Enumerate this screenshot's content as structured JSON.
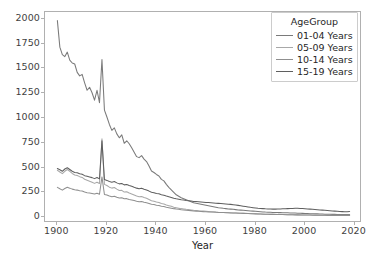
{
  "chart_data": {
    "type": "line",
    "title": "",
    "xlabel": "Year",
    "ylabel": "",
    "xlim": [
      1895,
      2023
    ],
    "ylim": [
      -60,
      2070
    ],
    "grid": false,
    "legend": {
      "title": "AgeGroup",
      "position": "upper right",
      "entries": [
        "01-04 Years",
        "05-09 Years",
        "10-14 Years",
        "15-19 Years"
      ]
    },
    "xticks": [
      1900,
      1920,
      1940,
      1960,
      1980,
      2000,
      2020
    ],
    "yticks": [
      0,
      250,
      500,
      750,
      1000,
      1250,
      1500,
      1750,
      2000
    ],
    "colors": {
      "01-04 Years": "#7a7a7a",
      "05-09 Years": "#a8a8a8",
      "10-14 Years": "#8f8f8f",
      "15-19 Years": "#5f5f5f"
    },
    "x": [
      1900,
      1901,
      1902,
      1903,
      1904,
      1905,
      1906,
      1907,
      1908,
      1909,
      1910,
      1911,
      1912,
      1913,
      1914,
      1915,
      1916,
      1917,
      1918,
      1919,
      1920,
      1921,
      1922,
      1923,
      1924,
      1925,
      1926,
      1927,
      1928,
      1929,
      1930,
      1931,
      1932,
      1933,
      1934,
      1935,
      1936,
      1937,
      1938,
      1939,
      1940,
      1941,
      1942,
      1943,
      1944,
      1945,
      1946,
      1947,
      1948,
      1949,
      1950,
      1951,
      1952,
      1953,
      1954,
      1955,
      1956,
      1957,
      1958,
      1959,
      1960,
      1961,
      1962,
      1963,
      1964,
      1965,
      1966,
      1967,
      1968,
      1969,
      1970,
      1971,
      1972,
      1973,
      1974,
      1975,
      1976,
      1977,
      1978,
      1979,
      1980,
      1981,
      1982,
      1983,
      1984,
      1985,
      1986,
      1987,
      1988,
      1989,
      1990,
      1991,
      1992,
      1993,
      1994,
      1995,
      1996,
      1997,
      1998,
      1999,
      2000,
      2001,
      2002,
      2003,
      2004,
      2005,
      2006,
      2007,
      2008,
      2009,
      2010,
      2011,
      2012,
      2013,
      2014,
      2015,
      2016,
      2017,
      2018
    ],
    "series": [
      {
        "name": "01-04 Years",
        "color": "#7a7a7a",
        "values": [
          1983,
          1715,
          1640,
          1620,
          1665,
          1585,
          1555,
          1545,
          1460,
          1425,
          1440,
          1355,
          1280,
          1310,
          1255,
          1180,
          1280,
          1155,
          1590,
          1080,
          1010,
          935,
          875,
          900,
          840,
          800,
          830,
          745,
          770,
          740,
          700,
          655,
          610,
          600,
          620,
          585,
          560,
          515,
          465,
          450,
          430,
          415,
          380,
          365,
          330,
          300,
          275,
          250,
          225,
          210,
          195,
          185,
          175,
          165,
          155,
          145,
          140,
          135,
          130,
          125,
          120,
          115,
          110,
          105,
          100,
          95,
          92,
          88,
          85,
          82,
          80,
          78,
          75,
          72,
          70,
          68,
          66,
          64,
          62,
          60,
          58,
          56,
          54,
          52,
          50,
          49,
          48,
          47,
          46,
          45,
          45,
          44,
          44,
          43,
          42,
          41,
          40,
          39,
          38,
          37,
          36,
          35,
          34,
          33,
          32,
          32,
          31,
          30,
          29,
          28,
          28,
          27,
          27,
          26,
          26,
          25,
          25,
          25,
          26
        ]
      },
      {
        "name": "05-09 Years",
        "color": "#a8a8a8",
        "values": [
          472,
          455,
          438,
          462,
          480,
          462,
          440,
          425,
          420,
          408,
          400,
          382,
          372,
          362,
          352,
          340,
          352,
          338,
          790,
          330,
          318,
          302,
          292,
          298,
          282,
          268,
          270,
          252,
          255,
          242,
          232,
          222,
          212,
          205,
          208,
          198,
          190,
          178,
          165,
          160,
          152,
          148,
          138,
          132,
          122,
          115,
          108,
          100,
          95,
          90,
          85,
          82,
          78,
          75,
          72,
          68,
          66,
          64,
          62,
          60,
          58,
          56,
          54,
          52,
          50,
          48,
          47,
          46,
          45,
          44,
          43,
          42,
          41,
          40,
          39,
          38,
          37,
          36,
          35,
          34,
          33,
          32,
          31,
          30,
          29,
          28,
          28,
          27,
          27,
          26,
          26,
          25,
          25,
          24,
          24,
          23,
          23,
          22,
          22,
          21,
          21,
          20,
          20,
          20,
          19,
          19,
          19,
          18,
          18,
          18,
          17,
          17,
          17,
          17,
          17,
          17,
          17,
          17,
          18
        ]
      },
      {
        "name": "10-14 Years",
        "color": "#8f8f8f",
        "values": [
          300,
          285,
          272,
          288,
          300,
          292,
          282,
          275,
          272,
          265,
          262,
          252,
          246,
          242,
          238,
          232,
          240,
          230,
          405,
          228,
          222,
          212,
          206,
          210,
          200,
          192,
          194,
          184,
          186,
          178,
          172,
          166,
          160,
          155,
          158,
          150,
          145,
          138,
          130,
          126,
          120,
          117,
          110,
          106,
          100,
          95,
          90,
          85,
          81,
          78,
          74,
          72,
          69,
          67,
          65,
          62,
          60,
          58,
          57,
          55,
          54,
          52,
          51,
          50,
          48,
          47,
          46,
          45,
          44,
          43,
          42,
          41,
          40,
          39,
          38,
          37,
          36,
          35,
          34,
          33,
          32,
          31,
          30,
          29,
          28,
          28,
          27,
          27,
          26,
          26,
          25,
          25,
          24,
          24,
          23,
          23,
          22,
          22,
          21,
          21,
          20,
          20,
          20,
          19,
          19,
          19,
          18,
          18,
          18,
          17,
          17,
          17,
          17,
          16,
          16,
          16,
          16,
          16,
          17
        ]
      },
      {
        "name": "15-19 Years",
        "color": "#5f5f5f",
        "values": [
          490,
          478,
          462,
          485,
          498,
          480,
          462,
          450,
          448,
          438,
          432,
          418,
          412,
          405,
          398,
          388,
          400,
          385,
          770,
          378,
          370,
          358,
          352,
          358,
          345,
          335,
          338,
          325,
          328,
          318,
          310,
          300,
          292,
          285,
          290,
          280,
          272,
          262,
          250,
          246,
          238,
          235,
          225,
          220,
          212,
          205,
          198,
          190,
          184,
          180,
          175,
          172,
          168,
          165,
          162,
          158,
          156,
          154,
          152,
          150,
          148,
          146,
          144,
          142,
          140,
          138,
          136,
          134,
          132,
          130,
          128,
          125,
          122,
          118,
          114,
          110,
          106,
          102,
          98,
          95,
          92,
          89,
          87,
          85,
          83,
          82,
          81,
          80,
          80,
          81,
          82,
          83,
          84,
          85,
          86,
          87,
          88,
          88,
          87,
          86,
          84,
          82,
          80,
          78,
          76,
          74,
          72,
          70,
          68,
          66,
          64,
          62,
          60,
          58,
          56,
          55,
          54,
          54,
          56
        ]
      }
    ]
  }
}
